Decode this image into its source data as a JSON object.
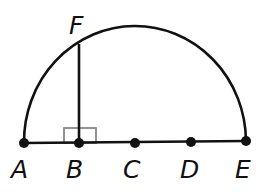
{
  "diagram": {
    "colors": {
      "stroke": "#111111",
      "right_angle": "#888888",
      "background": "#ffffff"
    },
    "points": [
      {
        "id": "A",
        "label": "A",
        "x": 24,
        "y": 143
      },
      {
        "id": "B",
        "label": "B",
        "x": 79,
        "y": 143
      },
      {
        "id": "C",
        "label": "C",
        "x": 135,
        "y": 143
      },
      {
        "id": "D",
        "label": "D",
        "x": 191,
        "y": 142
      },
      {
        "id": "E",
        "label": "E",
        "x": 246,
        "y": 141
      },
      {
        "id": "F",
        "label": "F",
        "x": 79,
        "y": 44
      }
    ],
    "segments": [
      {
        "from": "A",
        "to": "E",
        "name": "diameter AE"
      },
      {
        "from": "B",
        "to": "F",
        "name": "segment BF"
      }
    ],
    "arc": {
      "type": "semicircle",
      "from": "A",
      "to": "E",
      "center": "C"
    },
    "right_angle_marker": {
      "at": "B"
    },
    "labels": {
      "A": "A",
      "B": "B",
      "C": "C",
      "D": "D",
      "E": "E",
      "F": "F"
    }
  }
}
